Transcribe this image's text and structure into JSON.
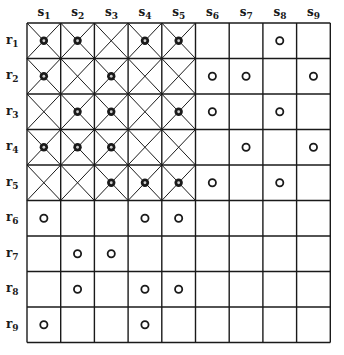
{
  "diagram": {
    "columns": [
      "s1",
      "s2",
      "s3",
      "s4",
      "s5",
      "s6",
      "s7",
      "s8",
      "s9"
    ],
    "rows": [
      "r1",
      "r2",
      "r3",
      "r4",
      "r5",
      "r6",
      "r7",
      "r8",
      "r9"
    ],
    "column_labels": [
      {
        "base": "s",
        "sub": "1"
      },
      {
        "base": "s",
        "sub": "2"
      },
      {
        "base": "s",
        "sub": "3"
      },
      {
        "base": "s",
        "sub": "4"
      },
      {
        "base": "s",
        "sub": "5"
      },
      {
        "base": "s",
        "sub": "6"
      },
      {
        "base": "s",
        "sub": "7"
      },
      {
        "base": "s",
        "sub": "8"
      },
      {
        "base": "s",
        "sub": "9"
      }
    ],
    "row_labels": [
      {
        "base": "r",
        "sub": "1"
      },
      {
        "base": "r",
        "sub": "2"
      },
      {
        "base": "r",
        "sub": "3"
      },
      {
        "base": "r",
        "sub": "4"
      },
      {
        "base": "r",
        "sub": "5"
      },
      {
        "base": "r",
        "sub": "6"
      },
      {
        "base": "r",
        "sub": "7"
      },
      {
        "base": "r",
        "sub": "8"
      },
      {
        "base": "r",
        "sub": "9"
      }
    ],
    "crossed_region": {
      "rows": [
        1,
        5
      ],
      "columns": [
        1,
        5
      ]
    },
    "marks": [
      {
        "row": 1,
        "col": 1,
        "style": "dotted"
      },
      {
        "row": 1,
        "col": 2,
        "style": "dotted"
      },
      {
        "row": 1,
        "col": 4,
        "style": "dotted"
      },
      {
        "row": 1,
        "col": 5,
        "style": "dotted"
      },
      {
        "row": 1,
        "col": 8,
        "style": "ring"
      },
      {
        "row": 2,
        "col": 1,
        "style": "dotted"
      },
      {
        "row": 2,
        "col": 3,
        "style": "dotted"
      },
      {
        "row": 2,
        "col": 6,
        "style": "ring"
      },
      {
        "row": 2,
        "col": 7,
        "style": "ring"
      },
      {
        "row": 2,
        "col": 9,
        "style": "ring"
      },
      {
        "row": 3,
        "col": 2,
        "style": "dotted"
      },
      {
        "row": 3,
        "col": 3,
        "style": "dotted"
      },
      {
        "row": 3,
        "col": 5,
        "style": "dotted"
      },
      {
        "row": 3,
        "col": 6,
        "style": "ring"
      },
      {
        "row": 3,
        "col": 8,
        "style": "ring"
      },
      {
        "row": 4,
        "col": 1,
        "style": "dotted"
      },
      {
        "row": 4,
        "col": 2,
        "style": "dotted"
      },
      {
        "row": 4,
        "col": 3,
        "style": "dotted"
      },
      {
        "row": 4,
        "col": 7,
        "style": "ring"
      },
      {
        "row": 4,
        "col": 9,
        "style": "ring"
      },
      {
        "row": 5,
        "col": 3,
        "style": "dotted"
      },
      {
        "row": 5,
        "col": 4,
        "style": "dotted"
      },
      {
        "row": 5,
        "col": 5,
        "style": "dotted"
      },
      {
        "row": 5,
        "col": 6,
        "style": "ring"
      },
      {
        "row": 5,
        "col": 8,
        "style": "ring"
      },
      {
        "row": 6,
        "col": 1,
        "style": "ring"
      },
      {
        "row": 6,
        "col": 4,
        "style": "ring"
      },
      {
        "row": 6,
        "col": 5,
        "style": "ring"
      },
      {
        "row": 7,
        "col": 2,
        "style": "ring"
      },
      {
        "row": 7,
        "col": 3,
        "style": "ring"
      },
      {
        "row": 8,
        "col": 2,
        "style": "ring"
      },
      {
        "row": 8,
        "col": 4,
        "style": "ring"
      },
      {
        "row": 8,
        "col": 5,
        "style": "ring"
      },
      {
        "row": 9,
        "col": 1,
        "style": "ring"
      },
      {
        "row": 9,
        "col": 4,
        "style": "ring"
      }
    ],
    "colors": {
      "line": "#1a1a1a",
      "background": "#ffffff"
    }
  }
}
